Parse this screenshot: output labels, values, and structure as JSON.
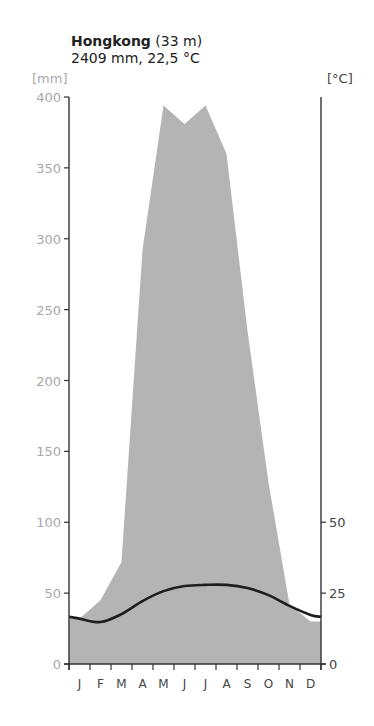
{
  "header": {
    "station": "Hongkong",
    "elevation": "(33 m)",
    "summary": "2409 mm, 22,5 °C"
  },
  "axes": {
    "left_unit": "[mm]",
    "right_unit": "[°C]",
    "left_ticks": [
      "400",
      "350",
      "300",
      "250",
      "200",
      "150",
      "100",
      "50",
      "0"
    ],
    "right_ticks": [
      "50",
      "25",
      "0"
    ]
  },
  "colors": {
    "precip_fill": "#b4b4b4",
    "temp_line": "#1e1e1e",
    "axis": "#333333",
    "left_tick_label": "#a8a8a8"
  },
  "chart_data": {
    "type": "area",
    "title": "Hongkong (33 m)",
    "subtitle": "2409 mm, 22,5 °C",
    "categories": [
      "J",
      "F",
      "M",
      "A",
      "M",
      "J",
      "J",
      "A",
      "S",
      "O",
      "N",
      "D"
    ],
    "series": [
      {
        "name": "Precipitation [mm]",
        "axis": "left",
        "kind": "area",
        "values": [
          32,
          45,
          72,
          292,
          394,
          381,
          394,
          360,
          235,
          128,
          42,
          30
        ]
      },
      {
        "name": "Temperature [°C]",
        "axis": "right",
        "kind": "line",
        "values": [
          16.0,
          14.8,
          17.6,
          22.2,
          25.7,
          27.5,
          27.9,
          27.9,
          26.8,
          24.3,
          20.5,
          17.3
        ]
      }
    ],
    "ylabel_left": "[mm]",
    "ylabel_right": "[°C]",
    "ylim_left": [
      0,
      400
    ],
    "ylim_right": [
      0,
      200
    ],
    "yticks_left": [
      0,
      50,
      100,
      150,
      200,
      250,
      300,
      350,
      400
    ],
    "yticks_right": [
      0,
      25,
      50
    ],
    "grid": false,
    "legend": "none"
  }
}
